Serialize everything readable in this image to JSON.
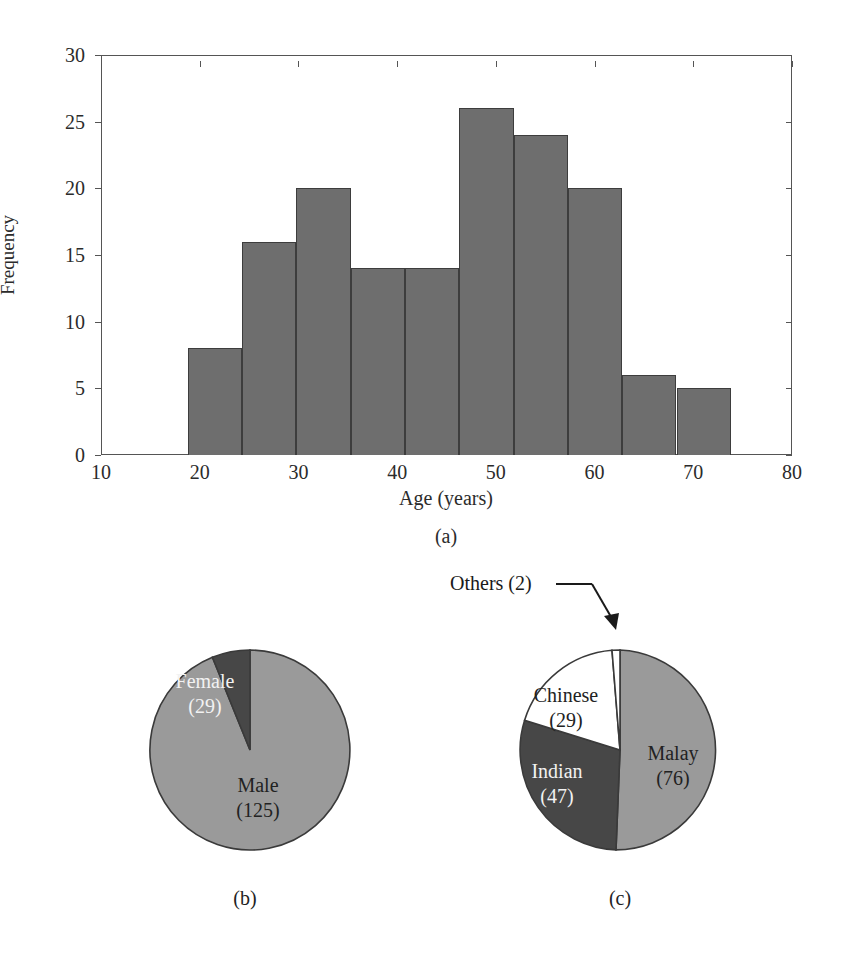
{
  "figure": {
    "panels": [
      {
        "id": "a",
        "caption": "(a)"
      },
      {
        "id": "b",
        "caption": "(b)"
      },
      {
        "id": "c",
        "caption": "(c)"
      }
    ]
  },
  "chart_data": [
    {
      "type": "bar",
      "panel": "(a)",
      "title": "",
      "xlabel": "Age (years)",
      "ylabel": "Frequency",
      "xlim": [
        10,
        80
      ],
      "ylim": [
        0,
        30
      ],
      "xticks": [
        "10",
        "20",
        "30",
        "40",
        "50",
        "60",
        "70",
        "80"
      ],
      "xtick_values": [
        10,
        20,
        30,
        40,
        50,
        60,
        70,
        80
      ],
      "yticks": [
        "0",
        "5",
        "10",
        "15",
        "20",
        "25",
        "30"
      ],
      "ytick_values": [
        0,
        5,
        10,
        15,
        20,
        25,
        30
      ],
      "grid": false,
      "legend": "none",
      "bin_edges": [
        18.8,
        24.3,
        29.8,
        35.3,
        40.8,
        46.3,
        51.8,
        57.3,
        62.8,
        68.3,
        73.8
      ],
      "categories": [
        "18.8-24.3",
        "24.3-29.8",
        "29.8-35.3",
        "35.3-40.8",
        "40.8-46.3",
        "46.3-51.8",
        "51.8-57.3",
        "57.3-62.8",
        "62.8-68.3",
        "68.3-73.8"
      ],
      "values": [
        8,
        16,
        20,
        14,
        14,
        26,
        24,
        20,
        6,
        5
      ],
      "bar_color": "#6e6e6e",
      "bar_edge_color": "#3d3d3d"
    },
    {
      "type": "pie",
      "panel": "(b)",
      "title": "",
      "labels": [
        "Male",
        "Female"
      ],
      "values": [
        125,
        29
      ],
      "total": 154,
      "display_labels": [
        "Male\n(125)",
        "Female\n(29)"
      ],
      "colors": [
        "#9a9a9a",
        "#474747"
      ],
      "legend": "none"
    },
    {
      "type": "pie",
      "panel": "(c)",
      "title": "",
      "labels": [
        "Malay",
        "Indian",
        "Chinese",
        "Others"
      ],
      "values": [
        76,
        47,
        29,
        2
      ],
      "total": 154,
      "display_labels": [
        "Malay\n(76)",
        "Indian\n(47)",
        "Chinese\n(29)",
        "Others (2)"
      ],
      "colors": [
        "#9a9a9a",
        "#474747",
        "#ffffff",
        "#ffffff"
      ],
      "annotation": {
        "text": "Others (2)",
        "target": "Others"
      },
      "legend": "none"
    }
  ],
  "histogram": {
    "ylabel": "Frequency",
    "xlabel": "Age (years)",
    "ytick_labels": [
      "0",
      "5",
      "10",
      "15",
      "20",
      "25",
      "30"
    ],
    "xtick_labels": [
      "10",
      "20",
      "30",
      "40",
      "50",
      "60",
      "70",
      "80"
    ]
  },
  "pie_b": {
    "slice1_line1": "Male",
    "slice1_line2": "(125)",
    "slice2_line1": "Female",
    "slice2_line2": "(29)"
  },
  "pie_c": {
    "slice1_line1": "Malay",
    "slice1_line2": "(76)",
    "slice2_line1": "Indian",
    "slice2_line2": "(47)",
    "slice3_line1": "Chinese",
    "slice3_line2": "(29)",
    "annotation": "Others (2)"
  },
  "captions": {
    "a": "(a)",
    "b": "(b)",
    "c": "(c)"
  }
}
